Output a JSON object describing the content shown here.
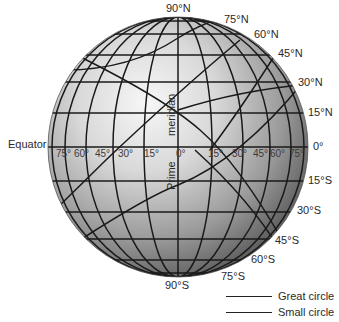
{
  "figure": {
    "type": "globe-graticule-diagram",
    "globe": {
      "center": [
        178,
        147
      ],
      "radius": 130
    },
    "colors": {
      "line": "#1a1a1a",
      "globe_light": "#f2f2f2",
      "globe_dark": "#4a4a4a",
      "text": "#2a2a2a"
    }
  },
  "latitude_labels": {
    "north": [
      {
        "id": "90n",
        "text": "90°N",
        "x": 166,
        "y": 3
      },
      {
        "id": "75n",
        "text": "75°N",
        "x": 224,
        "y": 14
      },
      {
        "id": "60n",
        "text": "60°N",
        "x": 254,
        "y": 29
      },
      {
        "id": "45n",
        "text": "45°N",
        "x": 278,
        "y": 48
      },
      {
        "id": "30n",
        "text": "30°N",
        "x": 298,
        "y": 77
      },
      {
        "id": "15n",
        "text": "15°N",
        "x": 308,
        "y": 107
      }
    ],
    "equator": {
      "id": "0",
      "text": "0°",
      "x": 313,
      "y": 141
    },
    "south": [
      {
        "id": "15s",
        "text": "15°S",
        "x": 308,
        "y": 175
      },
      {
        "id": "30s",
        "text": "30°S",
        "x": 297,
        "y": 205
      },
      {
        "id": "45s",
        "text": "45°S",
        "x": 275,
        "y": 235
      },
      {
        "id": "60s",
        "text": "60°S",
        "x": 251,
        "y": 254
      },
      {
        "id": "75s",
        "text": "75°S",
        "x": 221,
        "y": 271
      },
      {
        "id": "90s",
        "text": "90°S",
        "x": 165,
        "y": 280
      }
    ]
  },
  "longitude_labels": [
    {
      "text": "75°",
      "x": 56
    },
    {
      "text": "60°",
      "x": 74
    },
    {
      "text": "45°",
      "x": 95
    },
    {
      "text": "30°",
      "x": 118
    },
    {
      "text": "15°",
      "x": 144
    },
    {
      "text": "0°",
      "x": 176
    },
    {
      "text": "15°",
      "x": 208
    },
    {
      "text": "30°",
      "x": 232
    },
    {
      "text": "45°",
      "x": 253
    },
    {
      "text": "60°",
      "x": 270
    },
    {
      "text": "75°",
      "x": 289
    }
  ],
  "annotations": {
    "equator": "Equator",
    "prime_meridian_top": "meridian",
    "prime_meridian_bottom": "Prime"
  },
  "legend": {
    "items": [
      {
        "label": "Great circle"
      },
      {
        "label": "Small circle"
      }
    ]
  }
}
